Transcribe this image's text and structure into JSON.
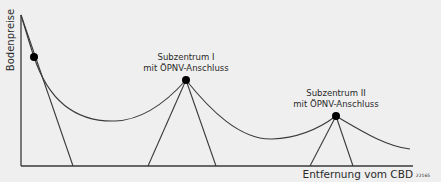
{
  "diagram": {
    "y_axis_label": "Bodenpreise",
    "x_axis_label": "Entfernung vom CBD",
    "figure_id": "22165",
    "centers": [
      {
        "name": "CBD",
        "label_line1": "",
        "label_line2": ""
      },
      {
        "name": "Subzentrum I",
        "label_line1": "Subzentrum I",
        "label_line2": "mit ÖPNV-Anschluss"
      },
      {
        "name": "Subzentrum II",
        "label_line1": "Subzentrum II",
        "label_line2": "mit ÖPNV-Anschluss"
      }
    ],
    "colors": {
      "line": "#3a3a3a",
      "background": "#efefef",
      "dot": "#000000"
    }
  }
}
